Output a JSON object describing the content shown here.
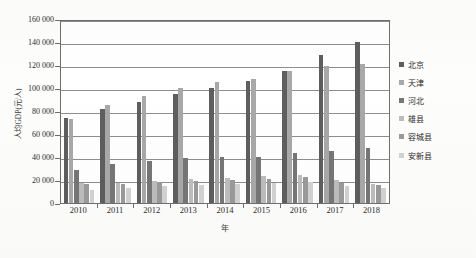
{
  "chart_data": {
    "type": "bar",
    "title": "",
    "xlabel": "年",
    "ylabel": "人均GDP(元/人)",
    "categories": [
      "2010",
      "2011",
      "2012",
      "2013",
      "2014",
      "2015",
      "2016",
      "2017",
      "2018"
    ],
    "ylim": [
      0,
      160000
    ],
    "ytick_step": 20000,
    "ytick_labels": [
      "0",
      "20 000",
      "40 000",
      "60 000",
      "80 000",
      "100 000",
      "120 000",
      "140 000",
      "160 000"
    ],
    "grid": true,
    "legend_position": "right",
    "series": [
      {
        "name": "北京",
        "color": "#5e5e5e",
        "values": [
          73856,
          81658,
          87475,
          94648,
          99995,
          106497,
          114690,
          128994,
          140211
        ]
      },
      {
        "name": "天津",
        "color": "#a8a8a8",
        "values": [
          72994,
          85213,
          93173,
          99607,
          105231,
          107960,
          115053,
          118944,
          120711
        ]
      },
      {
        "name": "河北",
        "color": "#767676",
        "values": [
          28668,
          33969,
          36584,
          38716,
          39984,
          40255,
          43062,
          45387,
          47772
        ]
      },
      {
        "name": "雄县",
        "color": "#bdbdbd",
        "values": [
          17012,
          17568,
          19024,
          20791,
          22013,
          23145,
          24320,
          19650,
          16400
        ]
      },
      {
        "name": "容城县",
        "color": "#9a9a9a",
        "values": [
          16320,
          16710,
          18160,
          19250,
          20110,
          21120,
          22330,
          17800,
          15300
        ]
      },
      {
        "name": "安新县",
        "color": "#d2d2d2",
        "values": [
          11420,
          13320,
          14500,
          15700,
          16600,
          17480,
          18600,
          14900,
          13100
        ]
      }
    ]
  },
  "axes": {
    "y_title": "人均GDP(元/人)",
    "x_title": "年"
  }
}
